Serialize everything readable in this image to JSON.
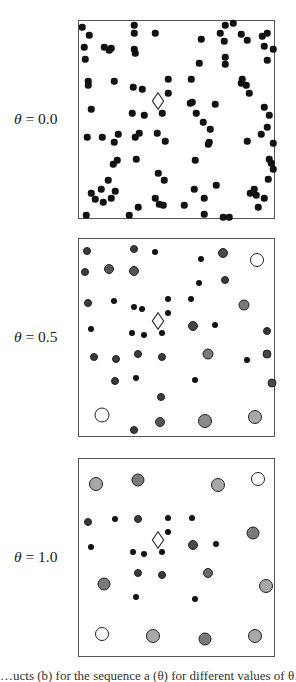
{
  "figure": {
    "panels": [
      {
        "label_symbol": "θ",
        "label_value": "= 0.0",
        "top": 20,
        "diamond": [
          79,
          80
        ],
        "points": [
          [
            3,
            6,
            6.5,
            "#111"
          ],
          [
            10,
            14,
            6.5,
            "#111"
          ],
          [
            5,
            26,
            6.5,
            "#111"
          ],
          [
            6,
            38,
            6.5,
            "#111"
          ],
          [
            25,
            26,
            6.5,
            "#111"
          ],
          [
            30,
            29,
            6.5,
            "#111"
          ],
          [
            32,
            27,
            6.5,
            "#111"
          ],
          [
            55,
            4,
            6.5,
            "#111"
          ],
          [
            55,
            12,
            6.5,
            "#111"
          ],
          [
            55,
            28,
            6.5,
            "#111"
          ],
          [
            56,
            32,
            6.5,
            "#111"
          ],
          [
            76,
            12,
            6.5,
            "#111"
          ],
          [
            9,
            60,
            6.5,
            "#111"
          ],
          [
            9,
            64,
            6.5,
            "#111"
          ],
          [
            35,
            60,
            6.5,
            "#111"
          ],
          [
            54,
            66,
            6.5,
            "#111"
          ],
          [
            63,
            68,
            6.5,
            "#111"
          ],
          [
            89,
            58,
            6.5,
            "#111"
          ],
          [
            89,
            72,
            6.5,
            "#111"
          ],
          [
            12,
            88,
            6.5,
            "#111"
          ],
          [
            53,
            92,
            6.5,
            "#111"
          ],
          [
            65,
            94,
            6.5,
            "#111"
          ],
          [
            83,
            92,
            6.5,
            "#111"
          ],
          [
            146,
            4,
            6.5,
            "#111"
          ],
          [
            154,
            2,
            6.5,
            "#111"
          ],
          [
            141,
            12,
            6.5,
            "#111"
          ],
          [
            122,
            18,
            6.5,
            "#111"
          ],
          [
            145,
            20,
            6.5,
            "#111"
          ],
          [
            162,
            13,
            6.5,
            "#111"
          ],
          [
            168,
            19,
            6.5,
            "#111"
          ],
          [
            183,
            15,
            6.5,
            "#111"
          ],
          [
            188,
            12,
            6.5,
            "#111"
          ],
          [
            185,
            25,
            6.5,
            "#111"
          ],
          [
            194,
            28,
            6.5,
            "#111"
          ],
          [
            188,
            39,
            6.5,
            "#111"
          ],
          [
            146,
            36,
            6.5,
            "#111"
          ],
          [
            146,
            43,
            6.5,
            "#111"
          ],
          [
            120,
            42,
            6.5,
            "#111"
          ],
          [
            112,
            58,
            6.5,
            "#111"
          ],
          [
            163,
            58,
            6.5,
            "#111"
          ],
          [
            162,
            62,
            6.5,
            "#111"
          ],
          [
            167,
            64,
            6.5,
            "#111"
          ],
          [
            170,
            72,
            6.5,
            "#111"
          ],
          [
            111,
            82,
            6.5,
            "#111"
          ],
          [
            113,
            81,
            6.5,
            "#111"
          ],
          [
            136,
            83,
            6.5,
            "#111"
          ],
          [
            117,
            92,
            6.5,
            "#111"
          ],
          [
            185,
            86,
            6.5,
            "#111"
          ],
          [
            190,
            94,
            6.5,
            "#111"
          ],
          [
            8,
            116,
            6.5,
            "#111"
          ],
          [
            23,
            116,
            6.5,
            "#111"
          ],
          [
            35,
            121,
            6.5,
            "#111"
          ],
          [
            39,
            113,
            6.5,
            "#111"
          ],
          [
            56,
            116,
            6.5,
            "#111"
          ],
          [
            60,
            112,
            6.5,
            "#111"
          ],
          [
            78,
            112,
            6.5,
            "#111"
          ],
          [
            86,
            120,
            6.5,
            "#111"
          ],
          [
            34,
            143,
            6.5,
            "#111"
          ],
          [
            38,
            139,
            6.5,
            "#111"
          ],
          [
            57,
            138,
            6.5,
            "#111"
          ],
          [
            29,
            159,
            6.5,
            "#111"
          ],
          [
            22,
            168,
            6.5,
            "#111"
          ],
          [
            12,
            172,
            6.5,
            "#111"
          ],
          [
            16,
            178,
            6.5,
            "#111"
          ],
          [
            24,
            181,
            6.5,
            "#111"
          ],
          [
            32,
            177,
            6.5,
            "#111"
          ],
          [
            36,
            170,
            6.5,
            "#111"
          ],
          [
            79,
            152,
            6.5,
            "#111"
          ],
          [
            85,
            159,
            6.5,
            "#111"
          ],
          [
            76,
            177,
            6.5,
            "#111"
          ],
          [
            80,
            183,
            6.5,
            "#111"
          ],
          [
            84,
            184,
            6.5,
            "#111"
          ],
          [
            59,
            186,
            6.5,
            "#111"
          ],
          [
            50,
            194,
            6.5,
            "#111"
          ],
          [
            7,
            194,
            6.5,
            "#111"
          ],
          [
            124,
            101,
            6.5,
            "#111"
          ],
          [
            131,
            108,
            6.5,
            "#111"
          ],
          [
            129,
            123,
            6.5,
            "#111"
          ],
          [
            130,
            121,
            6.5,
            "#111"
          ],
          [
            168,
            120,
            6.5,
            "#111"
          ],
          [
            182,
            113,
            6.5,
            "#111"
          ],
          [
            188,
            106,
            6.5,
            "#111"
          ],
          [
            194,
            122,
            6.5,
            "#111"
          ],
          [
            190,
            138,
            6.5,
            "#111"
          ],
          [
            192,
            142,
            6.5,
            "#111"
          ],
          [
            194,
            148,
            6.5,
            "#111"
          ],
          [
            116,
            139,
            6.5,
            "#111"
          ],
          [
            189,
            158,
            6.5,
            "#111"
          ],
          [
            137,
            164,
            6.5,
            "#111"
          ],
          [
            115,
            168,
            6.5,
            "#111"
          ],
          [
            125,
            177,
            6.5,
            "#111"
          ],
          [
            171,
            172,
            6.5,
            "#111"
          ],
          [
            175,
            168,
            6.5,
            "#111"
          ],
          [
            177,
            174,
            6.5,
            "#111"
          ],
          [
            185,
            177,
            6.5,
            "#111"
          ],
          [
            105,
            184,
            6.5,
            "#111"
          ],
          [
            125,
            193,
            6.5,
            "#111"
          ],
          [
            179,
            186,
            6.5,
            "#111"
          ],
          [
            144,
            196,
            6.5,
            "#111"
          ],
          [
            150,
            196,
            6.5,
            "#111"
          ]
        ]
      },
      {
        "label_symbol": "θ",
        "label_value": "= 0.5",
        "top": 238,
        "diamond": [
          79,
          82
        ],
        "points": [
          [
            8,
            12,
            8,
            "#3a3a3a"
          ],
          [
            55,
            10,
            8,
            "#3a3a3a"
          ],
          [
            76,
            13,
            6,
            "#111"
          ],
          [
            6,
            33,
            8,
            "#3a3a3a"
          ],
          [
            30,
            30,
            10,
            "#555"
          ],
          [
            55,
            32,
            10,
            "#555"
          ],
          [
            9,
            64,
            8,
            "#3a3a3a"
          ],
          [
            35,
            62,
            6,
            "#111"
          ],
          [
            55,
            68,
            6,
            "#111"
          ],
          [
            63,
            70,
            6,
            "#111"
          ],
          [
            89,
            60,
            6,
            "#111"
          ],
          [
            89,
            74,
            6,
            "#111"
          ],
          [
            12,
            90,
            6,
            "#111"
          ],
          [
            53,
            94,
            6,
            "#111"
          ],
          [
            65,
            96,
            6,
            "#111"
          ],
          [
            83,
            94,
            6,
            "#111"
          ],
          [
            122,
            20,
            6,
            "#111"
          ],
          [
            144,
            14,
            10,
            "#4a4a4a"
          ],
          [
            178,
            21,
            14,
            "#fff"
          ],
          [
            120,
            44,
            6,
            "#111"
          ],
          [
            146,
            41,
            8,
            "#3a3a3a"
          ],
          [
            112,
            60,
            6,
            "#111"
          ],
          [
            165,
            66,
            11,
            "#7a7a7a"
          ],
          [
            114,
            87,
            10,
            "#444"
          ],
          [
            136,
            86,
            6,
            "#111"
          ],
          [
            188,
            92,
            8,
            "#3a3a3a"
          ],
          [
            15,
            118,
            8,
            "#3a3a3a"
          ],
          [
            37,
            120,
            8,
            "#3a3a3a"
          ],
          [
            59,
            115,
            8,
            "#3a3a3a"
          ],
          [
            83,
            118,
            8,
            "#3a3a3a"
          ],
          [
            129,
            115,
            11,
            "#7a7a7a"
          ],
          [
            168,
            121,
            6,
            "#111"
          ],
          [
            188,
            115,
            9,
            "#444"
          ],
          [
            36,
            142,
            8,
            "#3a3a3a"
          ],
          [
            57,
            139,
            6,
            "#111"
          ],
          [
            116,
            141,
            6,
            "#111"
          ],
          [
            193,
            144,
            9,
            "#4a4a4a"
          ],
          [
            82,
            158,
            8,
            "#3a3a3a"
          ],
          [
            23,
            176,
            15,
            "#fff"
          ],
          [
            55,
            191,
            8,
            "#3a3a3a"
          ],
          [
            81,
            183,
            10,
            "#555"
          ],
          [
            126,
            182,
            14,
            "#8a8a8a"
          ],
          [
            176,
            178,
            14,
            "#a8a8a8"
          ]
        ]
      },
      {
        "label_symbol": "θ",
        "label_value": "= 1.0",
        "top": 458,
        "diamond": [
          79,
          81
        ],
        "points": [
          [
            17,
            25,
            14,
            "#a8a8a8"
          ],
          [
            59,
            21,
            13,
            "#7a7a7a"
          ],
          [
            139,
            26,
            14,
            "#a8a8a8"
          ],
          [
            179,
            20,
            14,
            "#fff"
          ],
          [
            9,
            63,
            8,
            "#3a3a3a"
          ],
          [
            36,
            60,
            6,
            "#111"
          ],
          [
            59,
            60,
            8,
            "#3a3a3a"
          ],
          [
            89,
            59,
            6,
            "#111"
          ],
          [
            113,
            59,
            6,
            "#111"
          ],
          [
            89,
            73,
            6,
            "#111"
          ],
          [
            174,
            74,
            13,
            "#7a7a7a"
          ],
          [
            12,
            88,
            6,
            "#111"
          ],
          [
            54,
            93,
            6,
            "#111"
          ],
          [
            65,
            95,
            6,
            "#111"
          ],
          [
            83,
            93,
            6,
            "#111"
          ],
          [
            114,
            86,
            10,
            "#4a4a4a"
          ],
          [
            137,
            85,
            6,
            "#111"
          ],
          [
            59,
            114,
            8,
            "#3a3a3a"
          ],
          [
            83,
            116,
            8,
            "#3a3a3a"
          ],
          [
            129,
            114,
            10,
            "#6a6a6a"
          ],
          [
            25,
            125,
            13,
            "#7a7a7a"
          ],
          [
            187,
            127,
            14,
            "#a8a8a8"
          ],
          [
            57,
            138,
            6,
            "#111"
          ],
          [
            116,
            140,
            6,
            "#111"
          ],
          [
            23,
            175,
            14,
            "#fff"
          ],
          [
            74,
            177,
            14,
            "#a8a8a8"
          ],
          [
            126,
            180,
            13,
            "#7a7a7a"
          ],
          [
            176,
            177,
            14,
            "#a8a8a8"
          ]
        ]
      }
    ],
    "caption_fragment": "…ucts (b) for the sequence a (θ) for different values of θ…"
  }
}
